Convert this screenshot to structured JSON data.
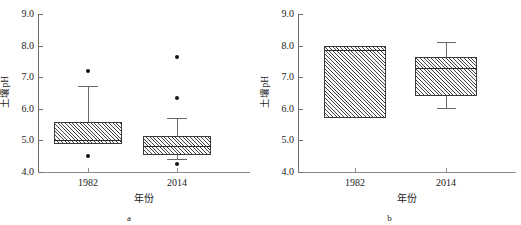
{
  "figure": {
    "panels": [
      {
        "id": "a",
        "label": "a",
        "ylabel": "土壤pH",
        "xlabel": "年份",
        "ytick_labels": [
          "9.0",
          "8.0",
          "7.0",
          "6.0",
          "5.0",
          "4.0"
        ],
        "xtick_labels": [
          "1982",
          "2014"
        ]
      },
      {
        "id": "b",
        "label": "b",
        "ylabel": "土壤pH",
        "xlabel": "年份",
        "ytick_labels": [
          "9.0",
          "8.0",
          "7.0",
          "6.0",
          "5.0",
          "4.0"
        ],
        "xtick_labels": [
          "1982",
          "2014"
        ]
      }
    ]
  },
  "chart_data": [
    {
      "type": "box",
      "panel": "a",
      "title": "",
      "xlabel": "年份",
      "ylabel": "土壤pH",
      "ylim": [
        4.0,
        9.0
      ],
      "yticks": [
        4.0,
        5.0,
        6.0,
        7.0,
        8.0,
        9.0
      ],
      "grid": false,
      "legend": "none",
      "categories": [
        "1982",
        "2014"
      ],
      "boxes": [
        {
          "category": "1982",
          "whisker_low": 4.87,
          "q1": 4.87,
          "median": 5.0,
          "q3": 5.58,
          "whisker_high": 6.73,
          "outliers": [
            7.2,
            4.5
          ],
          "has_low_whisker": false
        },
        {
          "category": "2014",
          "whisker_low": 4.4,
          "q1": 4.55,
          "median": 4.82,
          "q3": 5.15,
          "whisker_high": 5.7,
          "outliers": [
            7.65,
            6.33,
            4.24
          ],
          "has_low_whisker": true
        }
      ]
    },
    {
      "type": "box",
      "panel": "b",
      "title": "",
      "xlabel": "年份",
      "ylabel": "土壤pH",
      "ylim": [
        4.0,
        9.0
      ],
      "yticks": [
        4.0,
        5.0,
        6.0,
        7.0,
        8.0,
        9.0
      ],
      "grid": false,
      "legend": "none",
      "categories": [
        "1982",
        "2014"
      ],
      "boxes": [
        {
          "category": "1982",
          "whisker_low": 5.72,
          "q1": 5.72,
          "median": 7.87,
          "q3": 8.0,
          "whisker_high": 8.0,
          "outliers": [],
          "has_low_whisker": false,
          "has_high_whisker": false
        },
        {
          "category": "2014",
          "whisker_low": 6.02,
          "q1": 6.4,
          "median": 7.3,
          "q3": 7.65,
          "whisker_high": 8.12,
          "outliers": [],
          "has_low_whisker": true,
          "has_high_whisker": true
        }
      ]
    }
  ]
}
